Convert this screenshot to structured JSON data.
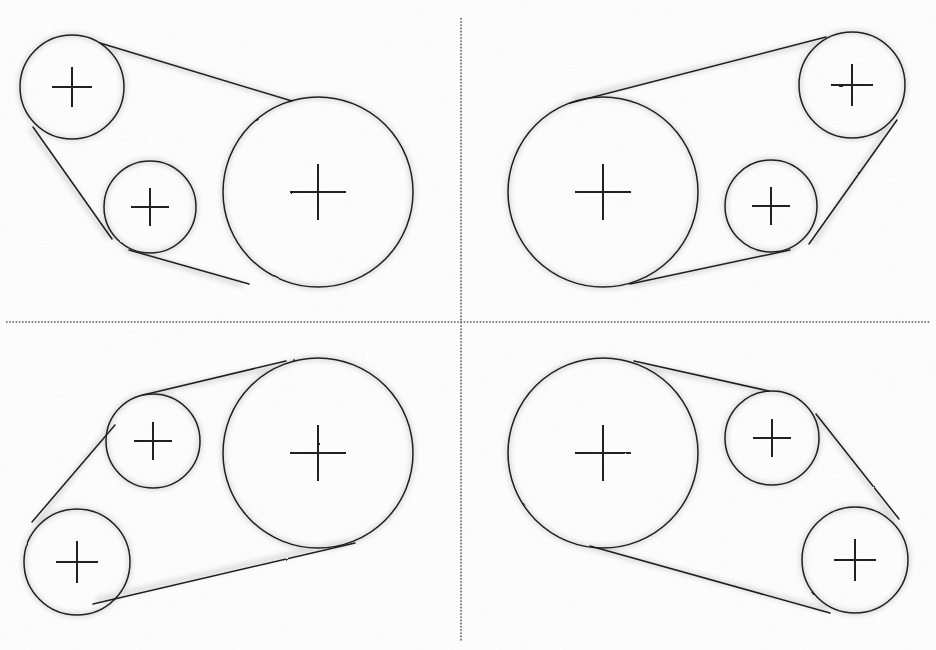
{
  "figure": {
    "width": 936,
    "height": 650,
    "background_color": "#fefefe",
    "line_color": "#1a1a1a",
    "divider_color": "#555555",
    "panel_count": 4
  },
  "dividers": {
    "vertical": {
      "x": 461,
      "y_start": 18,
      "y_end": 641,
      "style": "dotted"
    },
    "horizontal": {
      "y": 322,
      "x_start": 6,
      "x_end": 930,
      "style": "dotted"
    }
  },
  "panels": [
    {
      "id": "panel-top-left",
      "position": "top-left",
      "pulleys": [
        {
          "name": "small-upper-left",
          "cx": 72,
          "cy": 87,
          "r": 52,
          "mark": "crosshair"
        },
        {
          "name": "small-middle",
          "cx": 150,
          "cy": 207,
          "r": 46,
          "mark": "crosshair"
        },
        {
          "name": "large-right",
          "cx": 318,
          "cy": 192,
          "r": 95,
          "mark": "crosshair"
        }
      ],
      "belt": {
        "type": "open-belt-external-tangent",
        "wrap_order": [
          "small-upper-left",
          "large-right",
          "small-middle"
        ]
      }
    },
    {
      "id": "panel-top-right",
      "position": "top-right",
      "pulleys": [
        {
          "name": "large-left",
          "cx": 603,
          "cy": 192,
          "r": 95,
          "mark": "crosshair"
        },
        {
          "name": "small-upper-right",
          "cx": 852,
          "cy": 85,
          "r": 53,
          "mark": "crosshair"
        },
        {
          "name": "small-middle",
          "cx": 771,
          "cy": 206,
          "r": 46,
          "mark": "crosshair"
        }
      ],
      "belt": {
        "type": "open-belt-external-tangent",
        "wrap_order": [
          "large-left",
          "small-upper-right",
          "small-middle"
        ]
      }
    },
    {
      "id": "panel-bottom-left",
      "position": "bottom-left",
      "pulleys": [
        {
          "name": "small-upper",
          "cx": 153,
          "cy": 441,
          "r": 47,
          "mark": "crosshair"
        },
        {
          "name": "small-lower-left",
          "cx": 77,
          "cy": 562,
          "r": 53,
          "mark": "crosshair"
        },
        {
          "name": "large-right",
          "cx": 318,
          "cy": 453,
          "r": 95,
          "mark": "crosshair"
        }
      ],
      "belt": {
        "type": "open-belt-external-tangent",
        "wrap_order": [
          "small-upper",
          "large-right",
          "small-lower-left"
        ]
      }
    },
    {
      "id": "panel-bottom-right",
      "position": "bottom-right",
      "pulleys": [
        {
          "name": "large-left",
          "cx": 603,
          "cy": 453,
          "r": 95,
          "mark": "crosshair"
        },
        {
          "name": "small-upper-right",
          "cx": 772,
          "cy": 438,
          "r": 47,
          "mark": "crosshair"
        },
        {
          "name": "small-lower-right",
          "cx": 855,
          "cy": 560,
          "r": 53,
          "mark": "crosshair"
        }
      ],
      "belt": {
        "type": "open-belt-external-tangent",
        "wrap_order": [
          "large-left",
          "small-upper-right",
          "small-lower-right"
        ]
      }
    }
  ],
  "center_mark": {
    "style": "crosshair",
    "arm_length": 16,
    "stroke_width": 2
  }
}
